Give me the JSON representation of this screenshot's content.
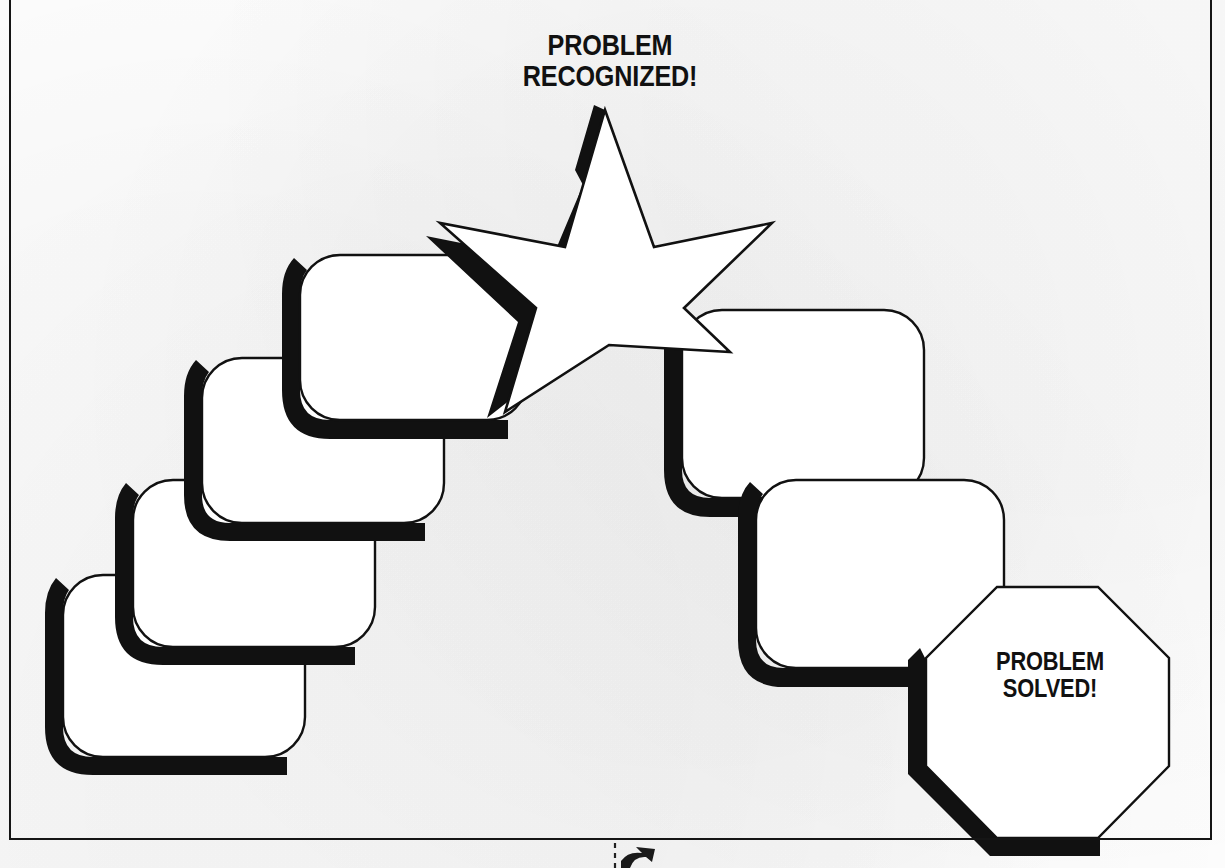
{
  "document": {
    "kind": "worksheet-diagram",
    "medium": "scanned-page",
    "ink_color": "#111111",
    "paper_color": "#fdfdfd"
  },
  "frame": {
    "name": "page-border",
    "stroke_color": "#151515"
  },
  "labels": {
    "star_title": "PROBLEM\nRECOGNIZED!",
    "octagon_title": "PROBLEM\nSOLVED!"
  },
  "diagram": {
    "shape_fill": "#ffffff",
    "outline_color": "#111111",
    "shadow_color": "#111111",
    "ascending_steps": [
      {
        "name": "step-box-1",
        "label": ""
      },
      {
        "name": "step-box-2",
        "label": ""
      },
      {
        "name": "step-box-3",
        "label": ""
      },
      {
        "name": "step-box-4",
        "label": ""
      }
    ],
    "descending_steps": [
      {
        "name": "step-box-5",
        "label": ""
      },
      {
        "name": "step-box-6",
        "label": ""
      }
    ],
    "star": {
      "name": "recognition-star",
      "points": 5,
      "label_ref": "star_title"
    },
    "octagon": {
      "name": "solution-octagon",
      "sides": 8,
      "label_ref": "octagon_title"
    }
  },
  "footer": {
    "divider_style": "dashed",
    "marker": "cursor-arrow-glyph"
  }
}
